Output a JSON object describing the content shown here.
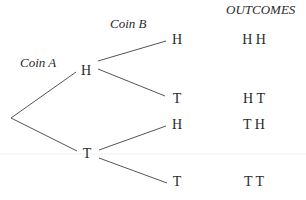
{
  "diagram": {
    "type": "probability-tree",
    "headers": {
      "coin_a": "Coin A",
      "coin_b": "Coin B",
      "outcomes": "OUTCOMES"
    },
    "level1": [
      {
        "label": "H"
      },
      {
        "label": "T"
      }
    ],
    "level2": [
      {
        "parent": "H",
        "label": "H",
        "outcome": "H H"
      },
      {
        "parent": "H",
        "label": "T",
        "outcome": "H T"
      },
      {
        "parent": "T",
        "label": "H",
        "outcome": "T H"
      },
      {
        "parent": "T",
        "label": "T",
        "outcome": "T T"
      }
    ],
    "colors": {
      "text": "#2a2a2a",
      "lines": "#555555",
      "background": "#ffffff"
    }
  }
}
